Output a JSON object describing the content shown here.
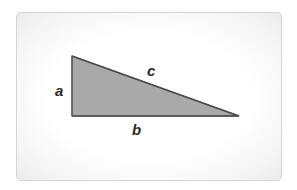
{
  "diagram": {
    "type": "right-triangle",
    "labels": {
      "a": "a",
      "b": "b",
      "c": "c"
    },
    "vertices": {
      "top_left": [
        72,
        56
      ],
      "bottom_left": [
        72,
        116
      ],
      "bottom_right": [
        239,
        116
      ]
    },
    "colors": {
      "fill": "#a9a9a9",
      "stroke": "#555555",
      "label": "#2a2a2a",
      "card_border": "#d4d4d4"
    }
  }
}
